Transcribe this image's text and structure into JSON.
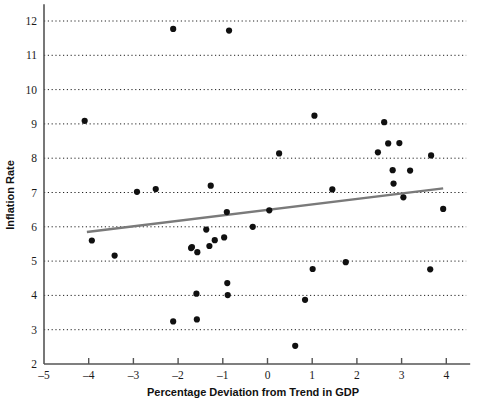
{
  "chart_data": {
    "type": "scatter",
    "title": "",
    "xlabel": "Percentage Deviation from Trend in GDP",
    "ylabel": "Inflation Rate",
    "xlim": [
      -5,
      4.4
    ],
    "ylim": [
      2,
      12.2
    ],
    "xticks": [
      -5,
      -4,
      -3,
      -2,
      -1,
      0,
      1,
      2,
      3,
      4
    ],
    "xticklabels": [
      "–5",
      "–4",
      "–3",
      "–2",
      "–1",
      "0",
      "1",
      "2",
      "3",
      "4"
    ],
    "yticks": [
      2,
      3,
      4,
      5,
      6,
      7,
      8,
      9,
      10,
      11,
      12
    ],
    "yticklabels": [
      "2",
      "3",
      "4",
      "5",
      "6",
      "7",
      "8",
      "9",
      "10",
      "11",
      "12"
    ],
    "grid": "horizontal-dotted",
    "legend": "none",
    "marker_color": "#101010",
    "trendline_color": "#7a7a7a",
    "axis_color": "#555555",
    "points": [
      {
        "x": -4.09,
        "y": 9.09
      },
      {
        "x": -3.93,
        "y": 5.6
      },
      {
        "x": -3.42,
        "y": 5.16
      },
      {
        "x": -2.92,
        "y": 7.02
      },
      {
        "x": -2.5,
        "y": 7.1
      },
      {
        "x": -2.11,
        "y": 11.77
      },
      {
        "x": -2.11,
        "y": 3.24
      },
      {
        "x": -1.71,
        "y": 5.38
      },
      {
        "x": -1.69,
        "y": 5.41
      },
      {
        "x": -1.59,
        "y": 4.05
      },
      {
        "x": -1.58,
        "y": 3.3
      },
      {
        "x": -1.57,
        "y": 5.26
      },
      {
        "x": -1.37,
        "y": 5.92
      },
      {
        "x": -1.3,
        "y": 5.44
      },
      {
        "x": -1.27,
        "y": 7.2
      },
      {
        "x": -1.18,
        "y": 5.61
      },
      {
        "x": -0.97,
        "y": 5.69
      },
      {
        "x": -0.91,
        "y": 6.43
      },
      {
        "x": -0.9,
        "y": 4.36
      },
      {
        "x": -0.89,
        "y": 4.01
      },
      {
        "x": -0.86,
        "y": 11.72
      },
      {
        "x": -0.33,
        "y": 6.0
      },
      {
        "x": 0.04,
        "y": 6.48
      },
      {
        "x": 0.26,
        "y": 8.14
      },
      {
        "x": 0.62,
        "y": 2.53
      },
      {
        "x": 0.84,
        "y": 3.87
      },
      {
        "x": 1.01,
        "y": 4.77
      },
      {
        "x": 1.05,
        "y": 9.24
      },
      {
        "x": 1.45,
        "y": 7.09
      },
      {
        "x": 1.75,
        "y": 4.97
      },
      {
        "x": 2.47,
        "y": 8.17
      },
      {
        "x": 2.61,
        "y": 9.05
      },
      {
        "x": 2.7,
        "y": 8.43
      },
      {
        "x": 2.8,
        "y": 7.65
      },
      {
        "x": 2.82,
        "y": 7.26
      },
      {
        "x": 2.95,
        "y": 8.44
      },
      {
        "x": 3.04,
        "y": 6.86
      },
      {
        "x": 3.19,
        "y": 7.64
      },
      {
        "x": 3.64,
        "y": 4.76
      },
      {
        "x": 3.66,
        "y": 8.08
      },
      {
        "x": 3.93,
        "y": 6.52
      }
    ],
    "trendline": {
      "x0": -4.04,
      "y0": 5.85,
      "x1": 3.93,
      "y1": 7.12
    }
  }
}
